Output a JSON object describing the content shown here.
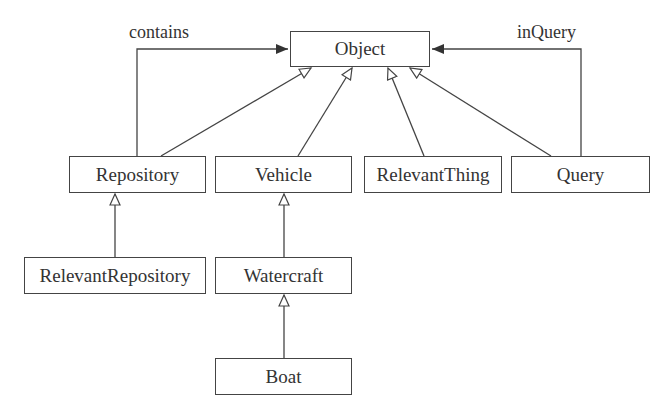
{
  "diagram": {
    "type": "uml-class-hierarchy",
    "nodes": [
      {
        "id": "object",
        "label": "Object",
        "x": 290,
        "y": 31,
        "w": 140,
        "h": 36
      },
      {
        "id": "repository",
        "label": "Repository",
        "x": 69,
        "y": 156,
        "w": 137,
        "h": 37
      },
      {
        "id": "vehicle",
        "label": "Vehicle",
        "x": 215,
        "y": 156,
        "w": 137,
        "h": 37
      },
      {
        "id": "relevantthing",
        "label": "RelevantThing",
        "x": 364,
        "y": 156,
        "w": 138,
        "h": 37
      },
      {
        "id": "query",
        "label": "Query",
        "x": 511,
        "y": 156,
        "w": 139,
        "h": 37
      },
      {
        "id": "relevantrepository",
        "label": "RelevantRepository",
        "x": 24,
        "y": 257,
        "w": 182,
        "h": 37
      },
      {
        "id": "watercraft",
        "label": "Watercraft",
        "x": 215,
        "y": 257,
        "w": 137,
        "h": 37
      },
      {
        "id": "boat",
        "label": "Boat",
        "x": 215,
        "y": 358,
        "w": 137,
        "h": 37
      }
    ],
    "edges": [
      {
        "from": "repository",
        "to": "object",
        "kind": "generalization"
      },
      {
        "from": "vehicle",
        "to": "object",
        "kind": "generalization"
      },
      {
        "from": "relevantthing",
        "to": "object",
        "kind": "generalization"
      },
      {
        "from": "query",
        "to": "object",
        "kind": "generalization"
      },
      {
        "from": "relevantrepository",
        "to": "repository",
        "kind": "generalization"
      },
      {
        "from": "watercraft",
        "to": "vehicle",
        "kind": "generalization"
      },
      {
        "from": "boat",
        "to": "watercraft",
        "kind": "generalization"
      },
      {
        "from": "repository",
        "to": "object",
        "kind": "association",
        "label": "contains"
      },
      {
        "from": "query",
        "to": "object",
        "kind": "association",
        "label": "inQuery"
      }
    ],
    "edge_labels": {
      "contains": "contains",
      "inQuery": "inQuery"
    },
    "colors": {
      "stroke": "#444444",
      "text": "#333333",
      "background": "#ffffff"
    }
  }
}
